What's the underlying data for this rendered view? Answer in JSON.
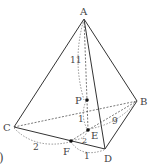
{
  "diagram": {
    "type": "tetrahedron-geometry",
    "stroke_color": "#333333",
    "dashed_color": "#555555",
    "vertices": {
      "A": {
        "label": "A",
        "x": 84,
        "y": 19
      },
      "B": {
        "label": "B",
        "x": 137,
        "y": 101
      },
      "C": {
        "label": "C",
        "x": 14,
        "y": 127
      },
      "D": {
        "label": "D",
        "x": 105,
        "y": 149
      }
    },
    "points": {
      "P": {
        "label": "P",
        "x": 87,
        "y": 100
      },
      "E": {
        "label": "E",
        "x": 88,
        "y": 130
      },
      "F": {
        "label": "F",
        "x": 71,
        "y": 141
      }
    },
    "measures": {
      "AP_arc": "11",
      "PE": "1",
      "EB": "9",
      "CF": "2",
      "FE": "2",
      "FD": "1"
    },
    "partial_label": ")"
  }
}
